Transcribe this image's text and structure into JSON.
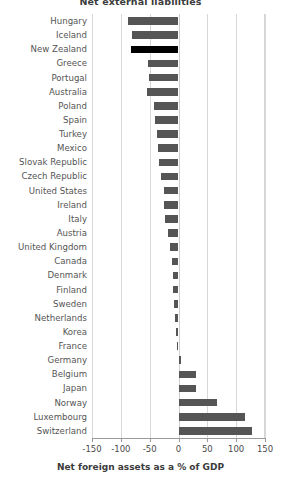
{
  "chart_data": {
    "type": "bar",
    "orientation": "horizontal",
    "title": "Net external liabilities",
    "xlabel": "Net foreign assets as a % of GDP",
    "ylabel": "",
    "xlim": [
      -150,
      150
    ],
    "xticks": [
      -150,
      -100,
      -50,
      0,
      50,
      100,
      150
    ],
    "xtick_labels": [
      "-150",
      "-100",
      "-50",
      "0",
      "50",
      "100",
      "150"
    ],
    "grid": true,
    "legend": "none",
    "bar_color": "#555555",
    "highlight_color": "#000000",
    "highlight_category": "New Zealand",
    "categories": [
      "Hungary",
      "Iceland",
      "New Zealand",
      "Greece",
      "Portugal",
      "Australia",
      "Poland",
      "Spain",
      "Turkey",
      "Mexico",
      "Slovak Republic",
      "Czech Republic",
      "United States",
      "Ireland",
      "Italy",
      "Austria",
      "United Kingdom",
      "Canada",
      "Denmark",
      "Finland",
      "Sweden",
      "Netherlands",
      "Korea",
      "France",
      "Germany",
      "Belgium",
      "Japan",
      "Norway",
      "Luxembourg",
      "Switzerland"
    ],
    "values": [
      -88,
      -80,
      -82,
      -53,
      -51,
      -54,
      -43,
      -41,
      -38,
      -36,
      -33,
      -30,
      -26,
      -25,
      -23,
      -18,
      -14,
      -12,
      -10,
      -9,
      -7,
      -6,
      -5,
      -3,
      4,
      30,
      31,
      66,
      115,
      128
    ]
  }
}
